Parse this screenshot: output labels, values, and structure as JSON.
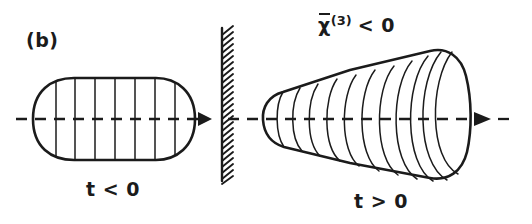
{
  "figure": {
    "panel_label": "(b)",
    "background_color": "#ffffff",
    "ink_color": "#1b1b1b",
    "width": 532,
    "height": 224
  },
  "labels": {
    "left_time": "t < 0",
    "right_time": "t > 0",
    "susceptibility": {
      "symbol": "χ",
      "overbar": true,
      "superscript": "(3)",
      "relation": "< 0",
      "full_text": "χ̄(3) < 0"
    }
  },
  "elements": {
    "left_pulse": {
      "name": "unchirped-pulse-capsule",
      "shape": "rounded-capsule",
      "rib_count": 7,
      "x_range": [
        33,
        195
      ],
      "y_range": [
        78,
        160
      ]
    },
    "barrier": {
      "name": "nonlinear-medium-interface",
      "shape": "hatched-vertical-line",
      "x": 222,
      "y_range": [
        28,
        181
      ],
      "hatch_direction": "up-right",
      "hatch_count": 26
    },
    "right_pulse": {
      "name": "defocused-pulse-cone",
      "shape": "flaring-cone",
      "rib_count": 11,
      "apex_x": 272,
      "x_range": [
        262,
        472
      ],
      "y_range": [
        50,
        182
      ]
    },
    "axis": {
      "name": "propagation-axis",
      "style": "dashed",
      "y": 119,
      "x_range": [
        16,
        514
      ],
      "arrow_positions": [
        207,
        487
      ]
    }
  }
}
